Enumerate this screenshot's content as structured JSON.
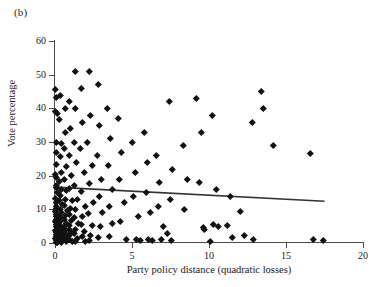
{
  "panel": {
    "label": "(b)"
  },
  "chart_data": {
    "type": "scatter",
    "title": "",
    "xlabel": "Party policy distance (quadratic losses)",
    "ylabel": "Vote percentage",
    "xlim": [
      0,
      20
    ],
    "ylim": [
      0,
      60
    ],
    "xticks": [
      0,
      5,
      10,
      15,
      20
    ],
    "yticks": [
      0,
      10,
      20,
      30,
      40,
      50,
      60
    ],
    "grid": false,
    "legend": null,
    "marker": "diamond",
    "marker_color": "#111111",
    "axis_color": "#4d4d4d",
    "trendline": {
      "type": "linear-fit",
      "x": [
        0.0,
        17.5
      ],
      "y": [
        16.6,
        12.4
      ],
      "color": "#333333"
    },
    "points": [
      [
        0.05,
        45.6
      ],
      [
        0.08,
        43.4
      ],
      [
        0.05,
        39.2
      ],
      [
        0.12,
        38.6
      ],
      [
        0.1,
        30.0
      ],
      [
        0.06,
        27.0
      ],
      [
        0.07,
        23.4
      ],
      [
        0.05,
        20.3
      ],
      [
        0.08,
        19.5
      ],
      [
        0.1,
        17.2
      ],
      [
        0.06,
        16.4
      ],
      [
        0.12,
        15.0
      ],
      [
        0.05,
        13.2
      ],
      [
        0.09,
        12.2
      ],
      [
        0.07,
        11.0
      ],
      [
        0.1,
        10.2
      ],
      [
        0.05,
        9.4
      ],
      [
        0.08,
        8.6
      ],
      [
        0.06,
        7.8
      ],
      [
        0.1,
        7.0
      ],
      [
        0.05,
        6.3
      ],
      [
        0.09,
        5.6
      ],
      [
        0.06,
        5.0
      ],
      [
        0.12,
        4.4
      ],
      [
        0.05,
        3.8
      ],
      [
        0.08,
        3.2
      ],
      [
        0.06,
        2.6
      ],
      [
        0.1,
        2.0
      ],
      [
        0.05,
        1.4
      ],
      [
        0.09,
        0.8
      ],
      [
        0.06,
        0.3
      ],
      [
        0.13,
        0.1
      ],
      [
        0.35,
        44.0
      ],
      [
        0.3,
        36.8
      ],
      [
        0.4,
        29.6
      ],
      [
        0.32,
        25.8
      ],
      [
        0.38,
        21.0
      ],
      [
        0.3,
        18.2
      ],
      [
        0.42,
        16.0
      ],
      [
        0.35,
        14.2
      ],
      [
        0.3,
        12.6
      ],
      [
        0.45,
        11.4
      ],
      [
        0.33,
        10.0
      ],
      [
        0.4,
        9.0
      ],
      [
        0.3,
        8.0
      ],
      [
        0.44,
        7.2
      ],
      [
        0.36,
        6.4
      ],
      [
        0.3,
        5.6
      ],
      [
        0.42,
        4.8
      ],
      [
        0.34,
        4.0
      ],
      [
        0.3,
        3.2
      ],
      [
        0.46,
        2.4
      ],
      [
        0.36,
        1.6
      ],
      [
        0.3,
        0.9
      ],
      [
        0.44,
        0.3
      ],
      [
        0.65,
        40.0
      ],
      [
        0.7,
        33.0
      ],
      [
        0.6,
        28.0
      ],
      [
        0.72,
        22.8
      ],
      [
        0.62,
        19.0
      ],
      [
        0.75,
        15.6
      ],
      [
        0.66,
        13.0
      ],
      [
        0.6,
        11.2
      ],
      [
        0.78,
        9.6
      ],
      [
        0.68,
        8.2
      ],
      [
        0.6,
        7.0
      ],
      [
        0.74,
        6.0
      ],
      [
        0.63,
        5.0
      ],
      [
        0.7,
        4.2
      ],
      [
        0.6,
        3.4
      ],
      [
        0.76,
        2.6
      ],
      [
        0.66,
        1.8
      ],
      [
        0.6,
        1.0
      ],
      [
        0.72,
        0.4
      ],
      [
        0.95,
        42.0
      ],
      [
        1.0,
        34.0
      ],
      [
        0.9,
        26.0
      ],
      [
        1.05,
        20.0
      ],
      [
        0.92,
        16.2
      ],
      [
        1.1,
        12.8
      ],
      [
        0.98,
        10.4
      ],
      [
        0.9,
        8.4
      ],
      [
        1.08,
        6.8
      ],
      [
        0.95,
        5.4
      ],
      [
        0.9,
        4.2
      ],
      [
        1.05,
        3.2
      ],
      [
        0.96,
        2.2
      ],
      [
        0.9,
        1.2
      ],
      [
        1.1,
        0.4
      ],
      [
        1.3,
        51.0
      ],
      [
        1.35,
        40.0
      ],
      [
        1.25,
        30.0
      ],
      [
        1.4,
        24.0
      ],
      [
        1.28,
        17.0
      ],
      [
        1.45,
        13.0
      ],
      [
        1.32,
        10.0
      ],
      [
        1.25,
        7.6
      ],
      [
        1.5,
        5.8
      ],
      [
        1.35,
        4.2
      ],
      [
        1.28,
        2.8
      ],
      [
        1.45,
        1.4
      ],
      [
        1.3,
        0.4
      ],
      [
        1.7,
        46.0
      ],
      [
        1.8,
        36.0
      ],
      [
        1.65,
        28.0
      ],
      [
        1.9,
        21.0
      ],
      [
        1.72,
        15.4
      ],
      [
        1.95,
        11.0
      ],
      [
        1.78,
        8.0
      ],
      [
        1.68,
        5.6
      ],
      [
        1.88,
        3.6
      ],
      [
        1.75,
        2.0
      ],
      [
        1.95,
        0.6
      ],
      [
        2.2,
        51.0
      ],
      [
        2.3,
        38.0
      ],
      [
        2.1,
        30.0
      ],
      [
        2.4,
        23.0
      ],
      [
        2.25,
        17.6
      ],
      [
        2.5,
        12.2
      ],
      [
        2.15,
        8.8
      ],
      [
        2.45,
        5.4
      ],
      [
        2.3,
        2.4
      ],
      [
        2.2,
        0.7
      ],
      [
        2.8,
        47.0
      ],
      [
        2.9,
        35.0
      ],
      [
        2.75,
        26.0
      ],
      [
        3.0,
        19.0
      ],
      [
        2.85,
        14.0
      ],
      [
        3.1,
        9.0
      ],
      [
        2.95,
        5.0
      ],
      [
        2.8,
        1.8
      ],
      [
        3.4,
        40.0
      ],
      [
        3.6,
        31.0
      ],
      [
        3.45,
        23.0
      ],
      [
        3.7,
        16.0
      ],
      [
        3.5,
        11.0
      ],
      [
        3.75,
        6.0
      ],
      [
        3.55,
        2.0
      ],
      [
        4.1,
        37.0
      ],
      [
        4.3,
        27.0
      ],
      [
        4.15,
        19.0
      ],
      [
        4.5,
        12.0
      ],
      [
        4.25,
        6.5
      ],
      [
        4.6,
        1.2
      ],
      [
        5.0,
        30.0
      ],
      [
        5.2,
        21.0
      ],
      [
        5.1,
        14.0
      ],
      [
        5.4,
        8.0
      ],
      [
        5.25,
        1.0
      ],
      [
        5.55,
        0.8
      ],
      [
        5.8,
        33.0
      ],
      [
        6.0,
        24.0
      ],
      [
        5.9,
        15.0
      ],
      [
        6.2,
        9.0
      ],
      [
        6.05,
        1.2
      ],
      [
        6.35,
        0.9
      ],
      [
        6.6,
        26.0
      ],
      [
        6.8,
        18.0
      ],
      [
        6.7,
        11.0
      ],
      [
        7.0,
        5.0
      ],
      [
        6.9,
        1.0
      ],
      [
        7.4,
        42.0
      ],
      [
        7.6,
        22.0
      ],
      [
        7.5,
        13.0
      ],
      [
        7.3,
        3.0
      ],
      [
        7.55,
        0.8
      ],
      [
        8.3,
        29.0
      ],
      [
        8.6,
        19.0
      ],
      [
        8.4,
        10.0
      ],
      [
        9.2,
        43.0
      ],
      [
        9.5,
        33.0
      ],
      [
        9.4,
        18.0
      ],
      [
        9.6,
        4.8
      ],
      [
        9.7,
        4.0
      ],
      [
        10.2,
        38.0
      ],
      [
        10.5,
        16.0
      ],
      [
        10.3,
        5.6
      ],
      [
        10.1,
        0.6
      ],
      [
        10.6,
        5.0
      ],
      [
        11.4,
        14.0
      ],
      [
        11.2,
        5.2
      ],
      [
        11.5,
        1.6
      ],
      [
        12.0,
        9.4
      ],
      [
        12.3,
        2.2
      ],
      [
        12.8,
        36.0
      ],
      [
        12.9,
        1.0
      ],
      [
        13.4,
        45.0
      ],
      [
        13.5,
        40.0
      ],
      [
        14.2,
        29.0
      ],
      [
        16.6,
        26.6
      ],
      [
        16.8,
        1.0
      ],
      [
        17.4,
        0.9
      ]
    ]
  }
}
